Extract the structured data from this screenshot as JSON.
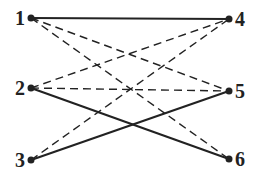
{
  "diagram": {
    "type": "bipartite-graph",
    "nodes": [
      {
        "id": "1",
        "label": "1",
        "side": "left",
        "row": 0
      },
      {
        "id": "2",
        "label": "2",
        "side": "left",
        "row": 1
      },
      {
        "id": "3",
        "label": "3",
        "side": "left",
        "row": 2
      },
      {
        "id": "4",
        "label": "4",
        "side": "right",
        "row": 0
      },
      {
        "id": "5",
        "label": "5",
        "side": "right",
        "row": 1
      },
      {
        "id": "6",
        "label": "6",
        "side": "right",
        "row": 2
      }
    ],
    "edges": [
      {
        "from": "1",
        "to": "4",
        "style": "solid"
      },
      {
        "from": "2",
        "to": "6",
        "style": "solid"
      },
      {
        "from": "3",
        "to": "5",
        "style": "solid"
      },
      {
        "from": "1",
        "to": "5",
        "style": "dashed"
      },
      {
        "from": "1",
        "to": "6",
        "style": "dashed"
      },
      {
        "from": "2",
        "to": "4",
        "style": "dashed"
      },
      {
        "from": "2",
        "to": "5",
        "style": "dashed"
      },
      {
        "from": "3",
        "to": "4",
        "style": "dashed"
      }
    ],
    "colors": {
      "line": "#222222",
      "node": "#222222",
      "background": "#ffffff"
    }
  }
}
